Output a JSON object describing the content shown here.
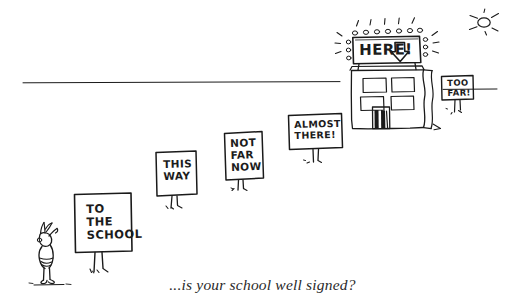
{
  "scene": {
    "title": "is your school well signed? cartoon",
    "background_color": "#ffffff",
    "ink_color": "#1a1a1a",
    "caption": "...is your school well signed?"
  },
  "signs": [
    {
      "id": "sign-to-the-school",
      "text": "TO\nTHE\nSCHOOL",
      "lines": [
        "TO",
        "THE",
        "SCHOOL"
      ],
      "order": 1
    },
    {
      "id": "sign-this-way",
      "text": "THIS\nWAY",
      "lines": [
        "THIS",
        "WAY"
      ],
      "order": 2
    },
    {
      "id": "sign-not-far-now",
      "text": "NOT\nFAR\nNOW",
      "lines": [
        "NOT",
        "FAR",
        "NOW"
      ],
      "order": 3
    },
    {
      "id": "sign-almost-there",
      "text": "ALMOST\nTHERE!",
      "lines": [
        "ALMOST",
        "THERE!"
      ],
      "order": 4
    },
    {
      "id": "sign-here",
      "text": "HERE!",
      "lines": [
        "HERE!"
      ],
      "order": 5,
      "arrow": "down-arrow",
      "bulbs": 7
    },
    {
      "id": "sign-too-far",
      "text": "TOO\nFAR!",
      "lines": [
        "TOO",
        "FAR!"
      ],
      "order": 6
    }
  ],
  "figures": {
    "person": "pupil-figure",
    "building": "school-building",
    "sun": "sun-icon",
    "horizon": "horizon-line"
  }
}
